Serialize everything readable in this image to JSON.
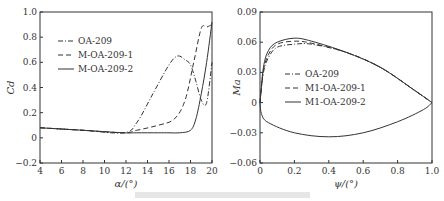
{
  "chart_data": [
    {
      "type": "line",
      "title": "",
      "xlabel": "α/(°)",
      "ylabel": "C_d",
      "xlim": [
        4,
        20
      ],
      "ylim": [
        -0.2,
        1.0
      ],
      "xticks": [
        "4",
        "6",
        "8",
        "10",
        "12",
        "14",
        "16",
        "18",
        "20"
      ],
      "yticks": [
        "−0.2",
        "0",
        "0.2",
        "0.4",
        "0.6",
        "0.8",
        "1.0"
      ],
      "legend_position": "upper left",
      "series": [
        {
          "name": "OA-209",
          "style": "dash-dot",
          "x": [
            4,
            8,
            11.8,
            13,
            14.5,
            16,
            16.8,
            17.5,
            18,
            18.5,
            19,
            19.5,
            20
          ],
          "y": [
            0.08,
            0.06,
            0.04,
            0.12,
            0.35,
            0.58,
            0.65,
            0.62,
            0.58,
            0.45,
            0.3,
            0.28,
            0.6
          ]
        },
        {
          "name": "M-OA-209-1",
          "style": "dashed",
          "x": [
            4,
            8,
            11.8,
            13,
            15,
            16.5,
            17.5,
            18.3,
            19,
            19.5,
            20
          ],
          "y": [
            0.08,
            0.06,
            0.04,
            0.06,
            0.1,
            0.15,
            0.3,
            0.6,
            0.87,
            0.88,
            0.9
          ]
        },
        {
          "name": "M-OA-209-2",
          "style": "solid",
          "x": [
            4,
            8,
            11.8,
            13,
            15,
            16,
            17,
            18,
            18.5,
            19,
            19.5,
            20
          ],
          "y": [
            0.08,
            0.06,
            0.04,
            0.04,
            0.04,
            0.04,
            0.04,
            0.06,
            0.15,
            0.35,
            0.6,
            0.92
          ]
        }
      ]
    },
    {
      "type": "line",
      "title": "",
      "xlabel": "ψ/(°)",
      "ylabel": "Ma",
      "xlim": [
        0,
        1.0
      ],
      "ylim": [
        -0.06,
        0.09
      ],
      "xticks": [
        "0",
        "0.2",
        "0.4",
        "0.6",
        "0.8",
        "1.0"
      ],
      "yticks": [
        "−0.06",
        "−0.03",
        "0",
        "0.03",
        "0.06",
        "0.09"
      ],
      "legend_position": "center left",
      "series": [
        {
          "name": "OA-209",
          "style": "dash-dot",
          "x": [
            0,
            0.02,
            0.05,
            0.1,
            0.2,
            0.3,
            0.5,
            0.7,
            0.9,
            1.0
          ],
          "y": [
            0,
            0.03,
            0.045,
            0.055,
            0.058,
            0.058,
            0.05,
            0.035,
            0.012,
            0
          ]
        },
        {
          "name": "M1-OA-209-1",
          "style": "dashed",
          "x": [
            0,
            0.02,
            0.05,
            0.1,
            0.2,
            0.3,
            0.5,
            0.7,
            0.9,
            1.0
          ],
          "y": [
            0,
            0.032,
            0.048,
            0.058,
            0.061,
            0.059,
            0.05,
            0.035,
            0.012,
            0
          ]
        },
        {
          "name": "M1-OA-209-2",
          "style": "solid",
          "x": [
            0,
            0.02,
            0.05,
            0.1,
            0.2,
            0.3,
            0.5,
            0.7,
            0.9,
            1.0
          ],
          "y": [
            0,
            0.035,
            0.052,
            0.06,
            0.064,
            0.061,
            0.05,
            0.035,
            0.012,
            0
          ]
        },
        {
          "name": "lower surface (all)",
          "style": "solid",
          "x": [
            0,
            0.01,
            0.05,
            0.2,
            0.4,
            0.6,
            0.8,
            0.95,
            1.0
          ],
          "y": [
            0,
            -0.012,
            -0.02,
            -0.03,
            -0.034,
            -0.03,
            -0.019,
            -0.007,
            0
          ]
        }
      ]
    }
  ],
  "caption": "图 ...（模糊，不可辨认）"
}
